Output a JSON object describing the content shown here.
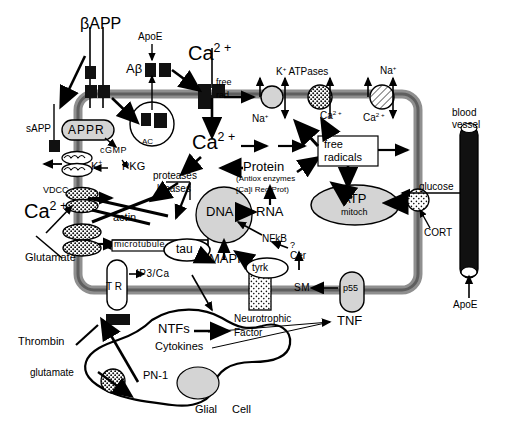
{
  "diagram": {
    "type": "cell-signaling-diagram",
    "colors": {
      "membrane": "#8c8c8c",
      "membrane_core": "#6e6e6e",
      "organelle_fill": "#d9d9d9",
      "channel_dark": "#111111",
      "vessel": "#111111",
      "outline": "#000000",
      "background": "#ffffff"
    }
  },
  "labels": {
    "bapp": "βAPP",
    "apoe_top": "ApoE",
    "abeta": "Aβ",
    "ca_extracellular_top": "Ca2+",
    "free": "free",
    "rad": "rad",
    "k_atpases": "K+ ATPases",
    "na_top_right": "Na+",
    "na_left_pump": "Na+",
    "ca_pump_mid": "Ca2+",
    "ca_pump_right": "Ca2+",
    "sapp": "sAPP",
    "appr": "APPR",
    "ac": "AC",
    "cgmp": "cGMP",
    "k_plus": "K+",
    "pkg": "PKG",
    "vdcc": "VDCC",
    "ca_left": "Ca2+",
    "glutamate_neuron": "Glutamate",
    "actin": "actin",
    "microtubule": "microtubule",
    "tau": "tau",
    "mapk": "MAPK",
    "ca_cytosol": "Ca2+",
    "proteases": "proteases",
    "kinases": "kinases",
    "protein": "Protein",
    "protein_sub1": "(Antiox   enzymes",
    "protein_sub2": "[Ca]i  Reg  Prot)",
    "dna": "DNA",
    "rna": "RNA",
    "nfkb": "NFkB",
    "question": "?",
    "cer": "Cer",
    "free_radicals_1": "free",
    "free_radicals_2": "radicals",
    "atp": "ATP",
    "mitoch": "mitoch",
    "blood_vessel_1": "blood",
    "blood_vessel_2": "vessel",
    "glucose": "glucose",
    "cort": "CORT",
    "apoe_vessel": "ApoE",
    "tyrk": "tyrk",
    "sm": "SM",
    "p55": "p55",
    "tnf": "TNF",
    "neurotrophic": "Neurotrophic",
    "factor": "Factor",
    "tr": "T R",
    "ip3ca": "IP3/Ca",
    "thrombin": "Thrombin",
    "glutamate_glial": "glutamate",
    "pn1": "PN-1",
    "ntfs": "NTFs",
    "cytokines": "Cytokines",
    "glial": "Glial",
    "cell": "Cell"
  }
}
